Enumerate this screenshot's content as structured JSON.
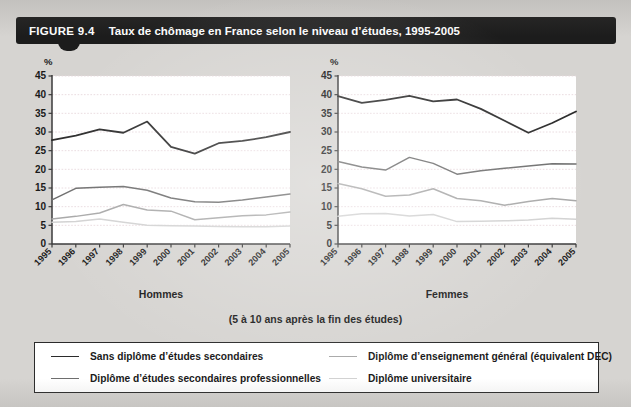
{
  "figure": {
    "number": "FIGURE 9.4",
    "title": "Taux de chômage en France selon le niveau d’études, 1995-2005",
    "sub_caption": "(5 à 10 ans après la fin des études)",
    "percent_symbol": "%"
  },
  "colors": {
    "page_background": "#d6d4d1",
    "title_bar": "#1c1c1c",
    "plot_background": "#ffffff",
    "gridline": "#e8d8dc",
    "axis": "#3a3a3a",
    "series_no_diploma": "#2b2b2b",
    "series_vocational": "#6e6e6e",
    "series_general": "#a8a8a8",
    "series_university": "#d2d2d2",
    "legend_border": "#2b2b2b",
    "text": "#1a1a1a"
  },
  "legend": {
    "items": [
      {
        "label": "Sans diplôme d’études secondaires",
        "color": "#2b2b2b",
        "column": 1,
        "row": 1
      },
      {
        "label": "Diplôme d’études secondaires professionnelles",
        "color": "#6e6e6e",
        "column": 1,
        "row": 2
      },
      {
        "label": "Diplôme d’enseignement général (équivalent DEC)",
        "color": "#a8a8a8",
        "column": 2,
        "row": 1
      },
      {
        "label": "Diplôme universitaire",
        "color": "#d2d2d2",
        "column": 2,
        "row": 2
      }
    ]
  },
  "chart_data": [
    {
      "type": "line",
      "panel": "left",
      "title": "Hommes",
      "xlabel": "Hommes",
      "ylabel": "%",
      "ylim": [
        0,
        45
      ],
      "yticks": [
        0,
        5,
        10,
        15,
        20,
        25,
        30,
        35,
        40,
        45
      ],
      "grid": true,
      "legend_position": "bottom-shared",
      "categories": [
        "1995",
        "1996",
        "1997",
        "1998",
        "1999",
        "2000",
        "2001",
        "2002",
        "2003",
        "2004",
        "2005"
      ],
      "series": [
        {
          "name": "Sans diplôme d’études secondaires",
          "color": "#2b2b2b",
          "values": [
            27.8,
            29.0,
            30.7,
            29.8,
            32.8,
            26.0,
            24.2,
            27.0,
            27.6,
            28.6,
            30.0
          ]
        },
        {
          "name": "Diplôme d’études secondaires professionnelles",
          "color": "#6e6e6e",
          "values": [
            11.8,
            14.9,
            15.2,
            15.4,
            14.4,
            12.3,
            11.3,
            11.2,
            11.8,
            12.6,
            13.4
          ]
        },
        {
          "name": "Diplôme d’enseignement général (équivalent DEC)",
          "color": "#a8a8a8",
          "values": [
            6.7,
            7.4,
            8.3,
            10.6,
            9.1,
            8.8,
            6.5,
            7.0,
            7.6,
            7.8,
            8.6
          ]
        },
        {
          "name": "Diplôme universitaire",
          "color": "#d2d2d2",
          "values": [
            5.8,
            6.0,
            6.7,
            5.8,
            5.0,
            4.9,
            4.8,
            4.7,
            4.6,
            4.6,
            4.8
          ]
        }
      ]
    },
    {
      "type": "line",
      "panel": "right",
      "title": "Femmes",
      "xlabel": "Femmes",
      "ylabel": "%",
      "ylim": [
        0,
        45
      ],
      "yticks": [
        0,
        5,
        10,
        15,
        20,
        25,
        30,
        35,
        40,
        45
      ],
      "grid": true,
      "legend_position": "bottom-shared",
      "categories": [
        "1995",
        "1996",
        "1997",
        "1998",
        "1999",
        "2000",
        "2001",
        "2002",
        "2003",
        "2004",
        "2005"
      ],
      "series": [
        {
          "name": "Sans diplôme d’études secondaires",
          "color": "#2b2b2b",
          "values": [
            39.6,
            37.8,
            38.6,
            39.7,
            38.2,
            38.7,
            36.2,
            33.0,
            29.8,
            32.4,
            35.5
          ]
        },
        {
          "name": "Diplôme d’études secondaires professionnelles",
          "color": "#6e6e6e",
          "values": [
            22.1,
            20.6,
            19.8,
            23.2,
            21.6,
            18.7,
            19.6,
            20.3,
            20.9,
            21.5,
            21.4
          ]
        },
        {
          "name": "Diplôme d’enseignement général (équivalent DEC)",
          "color": "#a8a8a8",
          "values": [
            16.2,
            14.8,
            12.8,
            13.1,
            14.8,
            12.2,
            11.6,
            10.4,
            11.4,
            12.2,
            11.6
          ]
        },
        {
          "name": "Diplôme universitaire",
          "color": "#d2d2d2",
          "values": [
            7.4,
            8.1,
            8.2,
            7.5,
            7.9,
            6.0,
            6.1,
            6.2,
            6.4,
            6.9,
            6.6
          ]
        }
      ]
    }
  ]
}
